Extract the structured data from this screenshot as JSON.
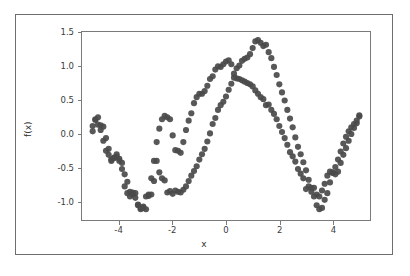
{
  "figure": {
    "background_color": "#ffffff",
    "frame_color": "#6e6e6e",
    "axes_color": "#7a7a7a",
    "marker_color": "#4a4a4a"
  },
  "chart_data": {
    "type": "scatter",
    "title": "",
    "xlabel": "x",
    "ylabel": "f(x)",
    "xlim": [
      -5.4,
      5.4
    ],
    "ylim": [
      -1.28,
      1.52
    ],
    "xticks": [
      -4,
      -2,
      0,
      2,
      4
    ],
    "xticklabels": [
      "-4",
      "-2",
      "0",
      "2",
      "4"
    ],
    "yticks": [
      -1.0,
      -0.5,
      0.0,
      0.5,
      1.0,
      1.5
    ],
    "yticklabels": [
      "-1.0",
      "-0.5",
      "0.0",
      "0.5",
      "1.0",
      "1.5"
    ],
    "grid": false,
    "legend": null,
    "marker_size": 4.2,
    "marker_color": "#4a4a4a",
    "marker_opacity": 0.92,
    "series": [
      {
        "name": "series-1",
        "color": "#4a4a4a",
        "x": [
          -5.0,
          -4.9,
          -4.8,
          -4.7,
          -4.6,
          -4.5,
          -4.4,
          -4.3,
          -4.2,
          -4.1,
          -4.0,
          -3.9,
          -3.8,
          -3.7,
          -3.6,
          -3.5,
          -3.4,
          -3.3,
          -3.2,
          -3.1,
          -3.0,
          -2.9,
          -2.8,
          -2.7,
          -2.6,
          -2.5,
          -2.4,
          -2.3,
          -2.2,
          -2.1,
          -2.0,
          -1.9,
          -1.8,
          -1.7,
          -1.6,
          -1.5,
          -1.4,
          -1.3,
          -1.2,
          -1.1,
          -1.0,
          -0.9,
          -0.8,
          -0.7,
          -0.6,
          -0.5,
          -0.4,
          -0.3,
          -0.2,
          -0.1,
          0.0,
          0.1,
          0.2,
          0.3,
          0.4,
          0.5,
          0.6,
          0.7,
          0.8,
          0.9,
          1.0,
          1.1,
          1.2,
          1.3,
          1.4,
          1.5,
          1.6,
          1.7,
          1.8,
          1.9,
          2.0,
          2.1,
          2.2,
          2.3,
          2.4,
          2.5,
          2.6,
          2.7,
          2.8,
          2.9,
          3.0,
          3.1,
          3.2,
          3.3,
          3.4,
          3.5,
          3.6,
          3.7,
          3.8,
          3.9,
          4.0,
          4.1,
          4.2,
          4.3,
          4.4,
          4.5,
          4.6,
          4.7,
          4.8,
          4.9,
          5.0
        ],
        "y": [
          0.04,
          0.22,
          0.25,
          0.13,
          0.11,
          -0.06,
          -0.22,
          -0.38,
          -0.36,
          -0.34,
          -0.37,
          -0.43,
          -0.6,
          -0.71,
          -0.93,
          -0.87,
          -0.88,
          -1.05,
          -1.1,
          -1.08,
          -1.12,
          -0.92,
          -0.9,
          -0.7,
          -0.4,
          -0.57,
          -0.66,
          -0.69,
          -0.87,
          -0.85,
          -0.89,
          -0.84,
          -0.86,
          -0.87,
          -0.83,
          -0.78,
          -0.7,
          -0.62,
          -0.55,
          -0.48,
          -0.38,
          -0.3,
          -0.22,
          -0.11,
          0.01,
          0.15,
          0.24,
          0.36,
          0.43,
          0.48,
          0.56,
          0.66,
          0.75,
          0.84,
          0.98,
          1.02,
          1.09,
          1.12,
          1.14,
          1.19,
          1.28,
          1.38,
          1.4,
          1.36,
          1.31,
          1.33,
          1.22,
          1.13,
          1.0,
          0.88,
          0.74,
          0.62,
          0.5,
          0.36,
          0.23,
          0.1,
          -0.05,
          -0.19,
          -0.3,
          -0.42,
          -0.54,
          -0.68,
          -0.8,
          -0.93,
          -1.06,
          -1.12,
          -1.1,
          -0.98,
          -0.88,
          -0.72,
          -0.58,
          -0.6,
          -0.56,
          -0.43,
          -0.31,
          -0.21,
          -0.1,
          0.0,
          0.09,
          0.16,
          0.28
        ]
      },
      {
        "name": "series-2",
        "color": "#4a4a4a",
        "x": [
          -5.0,
          -4.9,
          -4.8,
          -4.7,
          -4.6,
          -4.5,
          -4.4,
          -4.3,
          -4.2,
          -4.1,
          -4.0,
          -3.9,
          -3.8,
          -3.7,
          -3.6,
          -3.5,
          -3.4,
          -3.3,
          -3.2,
          -3.1,
          -3.0,
          -2.9,
          -2.8,
          -2.7,
          -2.6,
          -2.5,
          -2.4,
          -2.3,
          -2.2,
          -2.1,
          -2.0,
          -1.9,
          -1.8,
          -1.7,
          -1.6,
          -1.5,
          -1.4,
          -1.3,
          -1.2,
          -1.1,
          -1.0,
          -0.9,
          -0.8,
          -0.7,
          -0.6,
          -0.5,
          -0.4,
          -0.3,
          -0.2,
          -0.1,
          0.0,
          0.1,
          0.2,
          0.3,
          0.4,
          0.5,
          0.6,
          0.7,
          0.8,
          0.9,
          1.0,
          1.1,
          1.2,
          1.3,
          1.4,
          1.5,
          1.6,
          1.7,
          1.8,
          1.9,
          2.0,
          2.1,
          2.2,
          2.3,
          2.4,
          2.5,
          2.6,
          2.7,
          2.8,
          2.9,
          3.0,
          3.1,
          3.2,
          3.3,
          3.4,
          3.5,
          3.6,
          3.7,
          3.8,
          3.9,
          4.0,
          4.1,
          4.2,
          4.3,
          4.4,
          4.5,
          4.6,
          4.7,
          4.8,
          4.9,
          5.0
        ],
        "y": [
          0.12,
          0.21,
          0.14,
          0.06,
          -0.1,
          -0.25,
          -0.31,
          -0.4,
          -0.35,
          -0.3,
          -0.4,
          -0.52,
          -0.78,
          -0.88,
          -0.86,
          -0.9,
          -0.95,
          -1.06,
          -1.12,
          -1.1,
          -0.93,
          -0.9,
          -0.66,
          -0.4,
          -0.12,
          0.08,
          0.22,
          0.27,
          0.25,
          0.22,
          -0.02,
          -0.24,
          -0.25,
          -0.28,
          -0.12,
          0.06,
          0.2,
          0.31,
          0.46,
          0.55,
          0.6,
          0.6,
          0.64,
          0.72,
          0.82,
          0.86,
          0.96,
          1.01,
          1.0,
          1.04,
          1.08,
          1.1,
          1.04,
          0.9,
          0.83,
          0.82,
          0.8,
          0.78,
          0.76,
          0.74,
          0.71,
          0.65,
          0.6,
          0.55,
          0.52,
          0.43,
          0.44,
          0.36,
          0.3,
          0.22,
          0.12,
          0.03,
          -0.06,
          -0.16,
          -0.27,
          -0.33,
          -0.41,
          -0.52,
          -0.59,
          -0.66,
          -0.82,
          -0.78,
          -0.86,
          -0.8,
          -0.9,
          -0.93,
          -0.84,
          -0.74,
          -0.62,
          -0.56,
          -0.57,
          -0.49,
          -0.38,
          -0.26,
          -0.14,
          -0.04,
          0.04,
          0.1,
          0.15,
          0.2,
          0.26
        ]
      }
    ]
  }
}
